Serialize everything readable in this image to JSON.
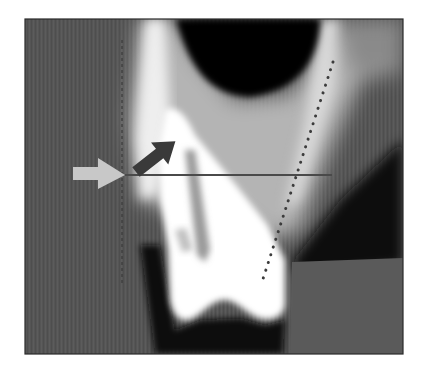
{
  "figure": {
    "type": "dental CBCT cross-sectional scan",
    "frame": {
      "x": 25,
      "y": 19,
      "width": 378,
      "height": 335,
      "border_color": "#2a2a2a"
    },
    "colors": {
      "background": "#ffffff",
      "soft_tissue": "#555555",
      "air": "#050505",
      "bone": "#cfcfcf",
      "tooth": "#ffffff",
      "light_arrow": "#c8c8c8",
      "dark_arrow": "#3a3a3a",
      "measure_line": "#4a4a4a",
      "dotted_line": "#3c3c3c"
    },
    "annotations": {
      "light_arrow": {
        "label": "light-gray-arrow",
        "tip": [
          125,
          175
        ],
        "direction": "right"
      },
      "dark_arrow": {
        "label": "dark-diagonal-arrow",
        "from": [
          132,
          170
        ],
        "to": [
          176,
          135
        ]
      },
      "horizontal_line": {
        "label": "horizontal-measurement-line",
        "from": [
          125,
          175
        ],
        "to": [
          332,
          175
        ]
      },
      "vertical_dashed_line": {
        "label": "vertical-reference-line",
        "x": 122,
        "y_from": 40,
        "y_to": 285
      },
      "dotted_line": {
        "label": "tooth-axis-dotted-line",
        "from": [
          333,
          62
        ],
        "to": [
          262,
          282
        ]
      }
    }
  }
}
